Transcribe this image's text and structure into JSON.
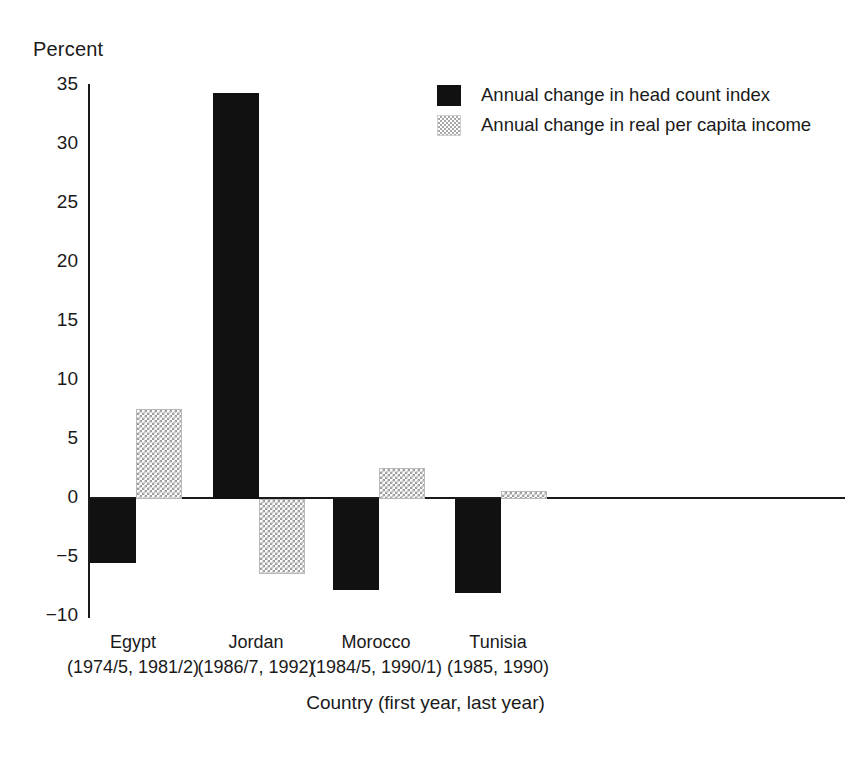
{
  "chart_data": {
    "type": "bar",
    "title": "",
    "subtitle": "",
    "xlabel": "Country (first year, last year)",
    "ylabel": "Percent",
    "categories": [
      "Egypt",
      "Jordan",
      "Morocco",
      "Tunisia"
    ],
    "category_sublabels": [
      "(1974/5, 1981/2)",
      "(1986/7, 1992)",
      "(1984/5, 1990/1)",
      "(1985, 1990)"
    ],
    "series": [
      {
        "name": "Annual change in head count index",
        "values": [
          -5.4,
          34.2,
          -7.6,
          -7.9
        ],
        "color": "#111111",
        "pattern": "solid"
      },
      {
        "name": "Annual change in real per capita income",
        "values": [
          7.6,
          -6.3,
          2.6,
          0.7
        ],
        "color": "#a0a0a0",
        "pattern": "checkered"
      }
    ],
    "ylim": [
      -10,
      35
    ],
    "yticks": [
      35,
      30,
      25,
      20,
      15,
      10,
      5,
      0,
      -5,
      -10
    ],
    "ytick_labels": [
      "35",
      "30",
      "25",
      "20",
      "15",
      "10",
      "5",
      "0",
      "−5",
      "−10"
    ],
    "grid": false,
    "legend_position": "top-right",
    "zero_line": true
  },
  "axes": {
    "y_title": "Percent",
    "x_title": "Country (first year, last year)"
  },
  "legend": {
    "items": [
      {
        "label": "Annual change in head count index",
        "swatch": "solid-black-swatch"
      },
      {
        "label": "Annual change in real per capita income",
        "swatch": "checkered-gray-swatch"
      }
    ]
  },
  "ticks": {
    "y": [
      "35",
      "30",
      "25",
      "20",
      "15",
      "10",
      "5",
      "0",
      "−5",
      "−10"
    ]
  },
  "groups": [
    {
      "name": "Egypt",
      "years": "(1974/5, 1981/2)"
    },
    {
      "name": "Jordan",
      "years": "(1986/7, 1992)"
    },
    {
      "name": "Morocco",
      "years": "(1984/5, 1990/1)"
    },
    {
      "name": "Tunisia",
      "years": "(1985, 1990)"
    }
  ],
  "colors": {
    "series1": "#111111",
    "series2": "#a0a0a0",
    "axis": "#1a1a1a",
    "background": "#ffffff"
  }
}
